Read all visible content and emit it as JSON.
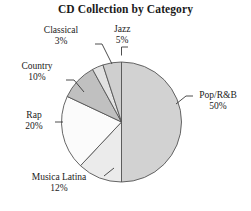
{
  "chart_data": {
    "type": "pie",
    "title": "CD Collection by Category",
    "categories": [
      "Pop/R&B",
      "Musica Latina",
      "Rap",
      "Country",
      "Classical",
      "Jazz"
    ],
    "values": [
      50,
      12,
      20,
      10,
      3,
      5
    ],
    "value_suffix": "%",
    "legend": "none",
    "grid": false,
    "colors": [
      "#d2d2d2",
      "#ebebeb",
      "#fbfbfb",
      "#c0c0c0",
      "#e2e2e2",
      "#cfcfcf"
    ],
    "slice_outline_color": "#555555",
    "start_angle_deg": 0,
    "direction": "clockwise",
    "labels": [
      {
        "name": "Pop/R&B",
        "label": "Pop/R&B",
        "pct": "50%"
      },
      {
        "name": "Musica Latina",
        "label": "Musica Latina",
        "pct": "12%"
      },
      {
        "name": "Rap",
        "label": "Rap",
        "pct": "20%"
      },
      {
        "name": "Country",
        "label": "Country",
        "pct": "10%"
      },
      {
        "name": "Classical",
        "label": "Classical",
        "pct": "3%"
      },
      {
        "name": "Jazz",
        "label": "Jazz",
        "pct": "5%"
      }
    ]
  },
  "chart": {
    "title": "CD Collection by Category",
    "label_jazz": "Jazz",
    "pct_jazz": "5%",
    "label_classical": "Classical",
    "pct_classical": "3%",
    "label_country": "Country",
    "pct_country": "10%",
    "label_rap": "Rap",
    "pct_rap": "20%",
    "label_musica_latina": "Musica Latina",
    "pct_musica_latina": "12%",
    "label_pop_rnb": "Pop/R&B",
    "pct_pop_rnb": "50%"
  }
}
